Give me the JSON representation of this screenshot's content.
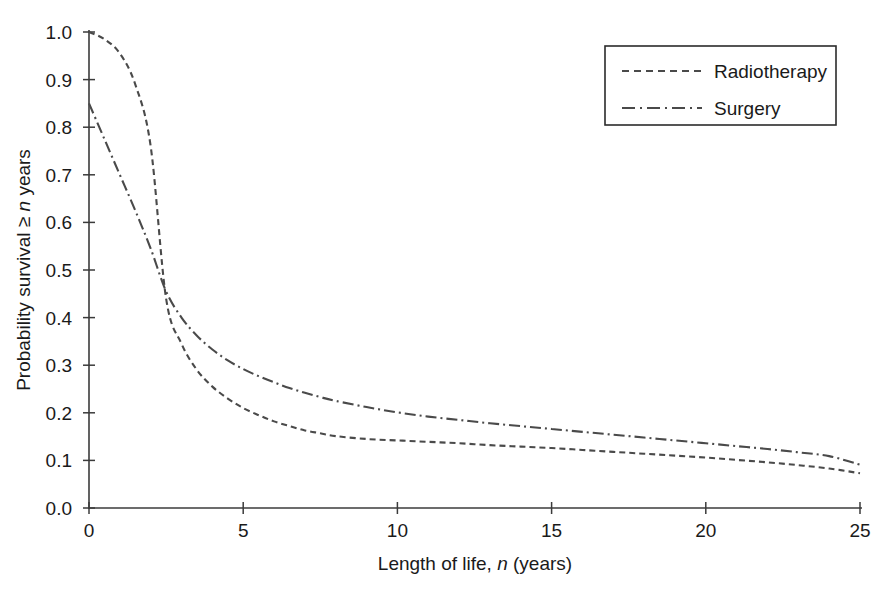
{
  "chart_data": {
    "type": "line",
    "title": "",
    "subtitle": "",
    "xlabel": "Length of life, n (years)",
    "xlabel_parts": {
      "pre": "Length of life, ",
      "italic": "n",
      "post": " (years)"
    },
    "ylabel": "Probability survival ≥ n years",
    "ylabel_parts": {
      "pre": "Probability survival ≥ ",
      "italic": "n",
      "post": " years"
    },
    "xlim": [
      0,
      25
    ],
    "ylim": [
      0.0,
      1.0
    ],
    "grid": false,
    "legend_position": "top-right",
    "xticks": [
      0,
      5,
      10,
      15,
      20,
      25
    ],
    "xtick_labels": [
      "0",
      "5",
      "10",
      "15",
      "20",
      "25"
    ],
    "yticks": [
      0.0,
      0.1,
      0.2,
      0.3,
      0.4,
      0.5,
      0.6,
      0.7,
      0.8,
      0.9,
      1.0
    ],
    "ytick_labels": [
      "0.0",
      "0.1",
      "0.2",
      "0.3",
      "0.4",
      "0.5",
      "0.6",
      "0.7",
      "0.8",
      "0.9",
      "1.0"
    ],
    "x": [
      0,
      0.5,
      1,
      1.5,
      2,
      2.5,
      3,
      3.5,
      4,
      4.5,
      5,
      5.5,
      6,
      6.5,
      7,
      7.5,
      8,
      9,
      10,
      11,
      12,
      13,
      14,
      15,
      16,
      17,
      18,
      19,
      20,
      21,
      22,
      23,
      24,
      25
    ],
    "series": [
      {
        "name": "Radiotherapy",
        "line_style": "dashed",
        "color": "#4a4a4a",
        "values": [
          1.0,
          0.985,
          0.955,
          0.89,
          0.76,
          0.44,
          0.345,
          0.29,
          0.255,
          0.23,
          0.21,
          0.195,
          0.182,
          0.172,
          0.163,
          0.157,
          0.151,
          0.145,
          0.142,
          0.139,
          0.136,
          0.132,
          0.129,
          0.126,
          0.122,
          0.118,
          0.114,
          0.11,
          0.106,
          0.101,
          0.096,
          0.09,
          0.083,
          0.073
        ]
      },
      {
        "name": "Surgery",
        "line_style": "dash-dot",
        "color": "#4a4a4a",
        "values": [
          0.85,
          0.775,
          0.7,
          0.625,
          0.545,
          0.455,
          0.4,
          0.362,
          0.333,
          0.31,
          0.292,
          0.277,
          0.264,
          0.252,
          0.242,
          0.233,
          0.225,
          0.212,
          0.201,
          0.192,
          0.185,
          0.178,
          0.172,
          0.166,
          0.16,
          0.154,
          0.148,
          0.142,
          0.136,
          0.13,
          0.124,
          0.117,
          0.109,
          0.091
        ]
      }
    ],
    "annotations": []
  },
  "legend": {
    "items": [
      {
        "label": "Radiotherapy",
        "style": "dashed"
      },
      {
        "label": "Surgery",
        "style": "dash-dot"
      }
    ]
  },
  "colors": {
    "axis": "#3b3b3b",
    "line": "#4a4a4a",
    "background": "#ffffff",
    "text": "#1a1a1a"
  }
}
